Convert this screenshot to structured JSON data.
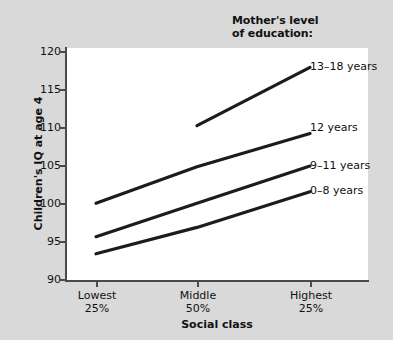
{
  "chart_data": {
    "type": "line",
    "title": "",
    "series_group_title_line1": "Mother's level",
    "series_group_title_line2": "of education:",
    "xlabel": "Social class",
    "ylabel": "Children's IQ at age 4",
    "categories": [
      "Lowest 25%",
      "Middle 50%",
      "Highest 25%"
    ],
    "category_lines": [
      {
        "line1": "Lowest",
        "line2": "25%"
      },
      {
        "line1": "Middle",
        "line2": "50%"
      },
      {
        "line1": "Highest",
        "line2": "25%"
      }
    ],
    "ylim": [
      90,
      120
    ],
    "yticks": [
      90,
      95,
      100,
      105,
      110,
      115,
      120
    ],
    "ytick_labels": [
      "90",
      "95",
      "100",
      "105",
      "110",
      "115",
      "120"
    ],
    "grid": false,
    "legend_position": "inline-right",
    "line_color": "#1c1c1c",
    "panel_color": "#ffffff",
    "background_color": "#d9d9d9",
    "series": [
      {
        "name": "13–18 years",
        "values": [
          null,
          110.0,
          117.5
        ]
      },
      {
        "name": "12 years",
        "values": [
          100.0,
          104.7,
          109.0
        ]
      },
      {
        "name": "9–11 years",
        "values": [
          95.7,
          100.0,
          104.8
        ]
      },
      {
        "name": "0–8 years",
        "values": [
          93.5,
          96.9,
          101.5
        ]
      }
    ]
  },
  "series_labels": [
    {
      "text": "13–18 years",
      "left": 310,
      "top": 61
    },
    {
      "text": "12 years",
      "left": 310,
      "top": 122
    },
    {
      "text": "9–11 years",
      "left": 310,
      "top": 160
    },
    {
      "text": "0–8 years",
      "left": 310,
      "top": 185
    }
  ],
  "yticks": [
    {
      "label": "120",
      "top": 46
    },
    {
      "label": "115",
      "top": 84
    },
    {
      "label": "110",
      "top": 122
    },
    {
      "label": "105",
      "top": 160
    },
    {
      "label": "100",
      "top": 198
    },
    {
      "label": "95",
      "top": 236
    },
    {
      "label": "90",
      "top": 274
    }
  ],
  "xticks": [
    {
      "line1": "Lowest",
      "line2": "25%",
      "left": 96
    },
    {
      "line1": "Middle",
      "line2": "50%",
      "left": 197
    },
    {
      "line1": "Highest",
      "line2": "25%",
      "left": 310
    }
  ]
}
